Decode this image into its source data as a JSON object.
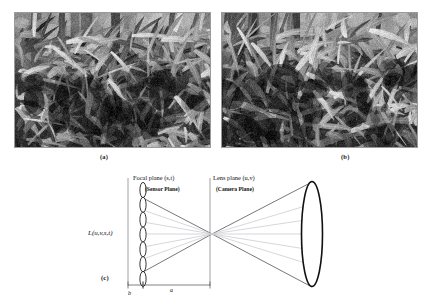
{
  "figure": {
    "panels": [
      {
        "id": "photo-a",
        "caption": "(a)",
        "alt_role": "photograph-left"
      },
      {
        "id": "photo-b",
        "caption": "(b)",
        "alt_role": "photograph-right"
      },
      {
        "id": "diagram",
        "caption": "(c)",
        "alt_role": "light-field-two-plane-diagram"
      }
    ]
  },
  "diagram": {
    "focal_plane": {
      "title": "Focal plane (s,t)",
      "subtitle": "(Sensor Plane)"
    },
    "lens_plane": {
      "title": "Lens plane (u,v)",
      "subtitle": "(Camera Plane)"
    },
    "radiance_label": "L(u,v,s,t)",
    "dimensions": {
      "b_label": "b",
      "a_label": "a"
    },
    "microlens_count": 7,
    "colors": {
      "ray_dark": "#4a4a52",
      "ray_light": "#c9c9cf",
      "plane_line": "#8b8b93",
      "outline": "#111111",
      "caption": "#1a1a1a"
    }
  },
  "captions": {
    "a": "(a)",
    "b": "(b)",
    "c": "(c)"
  }
}
